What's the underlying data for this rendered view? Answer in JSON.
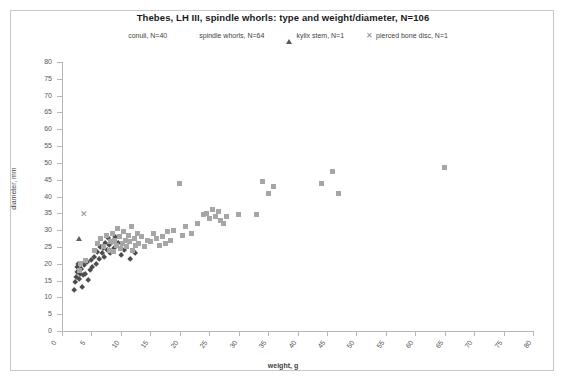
{
  "chart_data": {
    "type": "scatter",
    "title": "Thebes, LH III, spindle whorls: type and weight/diameter, N=106",
    "xlabel": "weight, g",
    "ylabel": "diameter, mm",
    "xlim": [
      0,
      80
    ],
    "ylim": [
      0,
      80
    ],
    "xticks": [
      0,
      5,
      10,
      15,
      20,
      25,
      30,
      35,
      40,
      45,
      50,
      55,
      60,
      65,
      70,
      75,
      80
    ],
    "yticks": [
      0,
      5,
      10,
      15,
      20,
      25,
      30,
      35,
      40,
      45,
      50,
      55,
      60,
      65,
      70,
      75,
      80
    ],
    "grid": false,
    "legend_position": "top",
    "series": [
      {
        "name": "conuli, N=40",
        "marker": "diamond",
        "color": "#4d4d4d",
        "points": [
          [
            2.0,
            12.0
          ],
          [
            2.3,
            14.5
          ],
          [
            2.4,
            16.0
          ],
          [
            2.5,
            17.5
          ],
          [
            2.6,
            19.0
          ],
          [
            2.8,
            20.0
          ],
          [
            3.0,
            15.5
          ],
          [
            3.1,
            17.0
          ],
          [
            3.2,
            18.5
          ],
          [
            3.3,
            20.0
          ],
          [
            3.5,
            13.0
          ],
          [
            3.6,
            16.5
          ],
          [
            3.8,
            19.5
          ],
          [
            4.0,
            17.0
          ],
          [
            4.2,
            20.5
          ],
          [
            4.5,
            15.0
          ],
          [
            4.8,
            18.0
          ],
          [
            5.0,
            21.0
          ],
          [
            5.2,
            19.0
          ],
          [
            5.5,
            22.0
          ],
          [
            5.8,
            20.0
          ],
          [
            6.0,
            23.5
          ],
          [
            6.3,
            21.5
          ],
          [
            6.5,
            25.0
          ],
          [
            6.8,
            23.0
          ],
          [
            7.0,
            24.5
          ],
          [
            7.2,
            22.0
          ],
          [
            7.4,
            26.0
          ],
          [
            7.6,
            24.0
          ],
          [
            7.8,
            27.5
          ],
          [
            8.0,
            25.5
          ],
          [
            8.2,
            23.0
          ],
          [
            8.5,
            26.5
          ],
          [
            8.8,
            24.5
          ],
          [
            9.0,
            28.0
          ],
          [
            9.5,
            26.0
          ],
          [
            10.0,
            22.5
          ],
          [
            10.5,
            24.0
          ],
          [
            11.5,
            21.5
          ],
          [
            12.5,
            23.0
          ]
        ]
      },
      {
        "name": "spindle whorls, N=64",
        "marker": "square",
        "color": "#a6a6a6",
        "points": [
          [
            3.0,
            18.0
          ],
          [
            3.2,
            20.0
          ],
          [
            4.0,
            21.0
          ],
          [
            5.5,
            24.0
          ],
          [
            6.0,
            26.0
          ],
          [
            6.5,
            27.5
          ],
          [
            7.0,
            25.0
          ],
          [
            7.5,
            28.5
          ],
          [
            8.0,
            24.0
          ],
          [
            8.2,
            26.5
          ],
          [
            8.5,
            29.0
          ],
          [
            8.8,
            23.5
          ],
          [
            9.0,
            27.0
          ],
          [
            9.3,
            25.5
          ],
          [
            9.5,
            30.5
          ],
          [
            9.8,
            28.0
          ],
          [
            10.0,
            24.5
          ],
          [
            10.2,
            26.0
          ],
          [
            10.5,
            29.5
          ],
          [
            10.8,
            27.0
          ],
          [
            11.0,
            25.0
          ],
          [
            11.3,
            28.5
          ],
          [
            11.5,
            26.5
          ],
          [
            11.8,
            31.0
          ],
          [
            12.0,
            24.0
          ],
          [
            12.3,
            27.5
          ],
          [
            12.5,
            25.5
          ],
          [
            12.8,
            29.0
          ],
          [
            13.0,
            26.0
          ],
          [
            13.5,
            28.0
          ],
          [
            14.0,
            25.0
          ],
          [
            14.5,
            27.0
          ],
          [
            15.0,
            26.5
          ],
          [
            15.5,
            29.0
          ],
          [
            16.0,
            27.5
          ],
          [
            16.5,
            25.5
          ],
          [
            17.0,
            28.0
          ],
          [
            17.5,
            26.0
          ],
          [
            18.0,
            29.5
          ],
          [
            18.5,
            27.0
          ],
          [
            19.0,
            30.0
          ],
          [
            20.0,
            44.0
          ],
          [
            20.5,
            28.5
          ],
          [
            21.0,
            31.0
          ],
          [
            22.0,
            29.0
          ],
          [
            23.0,
            32.0
          ],
          [
            24.0,
            34.5
          ],
          [
            24.5,
            35.0
          ],
          [
            25.0,
            33.5
          ],
          [
            25.5,
            36.0
          ],
          [
            26.0,
            34.0
          ],
          [
            26.5,
            35.5
          ],
          [
            27.0,
            33.0
          ],
          [
            27.5,
            32.0
          ],
          [
            28.0,
            34.0
          ],
          [
            30.0,
            34.5
          ],
          [
            33.0,
            34.5
          ],
          [
            34.0,
            44.5
          ],
          [
            35.0,
            41.0
          ],
          [
            36.0,
            43.0
          ],
          [
            44.0,
            44.0
          ],
          [
            46.0,
            47.5
          ],
          [
            47.0,
            41.0
          ],
          [
            65.0,
            48.5
          ]
        ]
      },
      {
        "name": "kylix stem, N=1",
        "marker": "triangle",
        "color": "#606060",
        "points": [
          [
            2.9,
            27.5
          ]
        ]
      },
      {
        "name": "pierced bone disc, N=1",
        "marker": "cross",
        "color": "#8c8c8c",
        "points": [
          [
            3.6,
            34.5
          ]
        ]
      }
    ]
  }
}
